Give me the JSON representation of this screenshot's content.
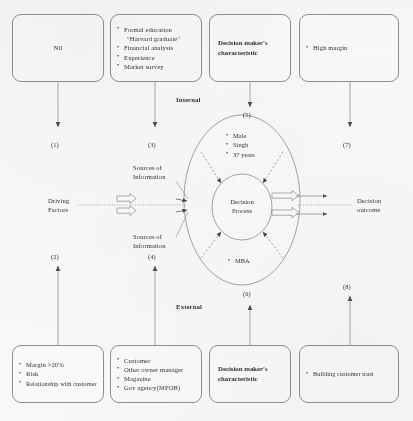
{
  "figure": {
    "type": "conceptual-framework-diagram",
    "colors": {
      "stroke": "#8d8d8d",
      "text": "#2b2b2b",
      "background": "#fdfdfc"
    }
  },
  "top_boxes": [
    {
      "id": "box-nil",
      "style": "centered-text",
      "text": "Nil",
      "connector_label": "(1)"
    },
    {
      "id": "box-formal-education",
      "style": "bullet-list",
      "items": [
        {
          "text": "Formal education",
          "continuation": "\"Harvard graduate\""
        },
        {
          "text": "Financial  analysis"
        },
        {
          "text": "Experience"
        },
        {
          "text": "Market survey"
        }
      ],
      "connector_label": "(3)"
    },
    {
      "id": "box-decision-maker-characteristic-top",
      "style": "left-text",
      "lines": [
        "Decision maker's",
        "characteristic"
      ],
      "connector_label": "(5)"
    },
    {
      "id": "box-high-margin",
      "style": "bullet-list",
      "items": [
        {
          "text": "High margin"
        }
      ],
      "connector_label": "(7)"
    }
  ],
  "bottom_boxes": [
    {
      "id": "box-margin-risk",
      "style": "bullet-list",
      "items": [
        {
          "text": "Margin  >20%"
        },
        {
          "text": "Risk"
        },
        {
          "text": "Relationship with customer"
        }
      ],
      "connector_label": "(2)"
    },
    {
      "id": "box-sources",
      "style": "bullet-list",
      "items": [
        {
          "text": "Customer"
        },
        {
          "text": "Other owner manager"
        },
        {
          "text": "Magazine"
        },
        {
          "text": "Gov agency(MPOB)"
        }
      ],
      "connector_label": "(4)"
    },
    {
      "id": "box-decision-maker-characteristic-bottom",
      "style": "left-text",
      "lines": [
        "Decision maker's",
        "characteristic"
      ],
      "connector_label": "(6)"
    },
    {
      "id": "box-building-customer-trust",
      "style": "bullet-list",
      "items": [
        {
          "text": "Building customer trust"
        }
      ],
      "connector_label": "(8)"
    }
  ],
  "zone_labels": {
    "internal": "Internal",
    "external": "External"
  },
  "flow_labels": {
    "driving_factors": [
      "Driving",
      "Factors"
    ],
    "decision_outcome": [
      "Decision",
      "outcome"
    ],
    "sources_of_information_upper": [
      "Sources of",
      "Information"
    ],
    "sources_of_information_lower": [
      "Sources of",
      "Information"
    ]
  },
  "ellipse": {
    "outer_top_items": [
      "Male",
      "Singh",
      "37 years"
    ],
    "outer_bottom_items": [
      "MBA"
    ],
    "core_lines": [
      "Decision",
      "Process"
    ]
  },
  "connector_numbers": {
    "n1": "(1)",
    "n2": "(2)",
    "n3": "(3)",
    "n4": "(4)",
    "n5": "(5)",
    "n6": "(6)",
    "n7": "(7)",
    "n8": "(8)"
  }
}
